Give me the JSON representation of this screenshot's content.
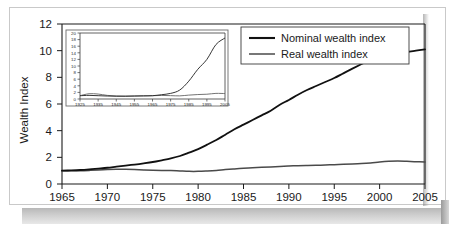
{
  "chart_data": {
    "type": "line",
    "title": "",
    "xlabel": "",
    "ylabel": "Wealth Index",
    "xlim": [
      1965,
      2005
    ],
    "ylim": [
      0,
      12
    ],
    "grid": false,
    "legend_position": "top-right",
    "xticks": [
      "1965",
      "1970",
      "1975",
      "1980",
      "1985",
      "1990",
      "1995",
      "2000",
      "2005"
    ],
    "yticks": [
      "0",
      "2",
      "4",
      "6",
      "8",
      "10",
      "12"
    ],
    "x": [
      1965,
      1966,
      1967,
      1968,
      1969,
      1970,
      1971,
      1972,
      1973,
      1974,
      1975,
      1976,
      1977,
      1978,
      1979,
      1980,
      1981,
      1982,
      1983,
      1984,
      1985,
      1986,
      1987,
      1988,
      1989,
      1990,
      1991,
      1992,
      1993,
      1994,
      1995,
      1996,
      1997,
      1998,
      1999,
      2000,
      2001,
      2002,
      2003,
      2004,
      2005
    ],
    "series": [
      {
        "name": "Nominal wealth index",
        "color": "#111111",
        "values": [
          1.0,
          1.02,
          1.05,
          1.1,
          1.16,
          1.22,
          1.3,
          1.38,
          1.46,
          1.55,
          1.65,
          1.78,
          1.92,
          2.1,
          2.35,
          2.62,
          2.95,
          3.3,
          3.7,
          4.1,
          4.45,
          4.8,
          5.15,
          5.5,
          5.95,
          6.3,
          6.7,
          7.05,
          7.35,
          7.65,
          7.95,
          8.3,
          8.65,
          9.0,
          9.35,
          9.5,
          9.62,
          9.75,
          9.9,
          10.0,
          10.1
        ]
      },
      {
        "name": "Real wealth index",
        "color": "#4a4a4a",
        "values": [
          1.0,
          1.0,
          1.0,
          1.02,
          1.05,
          1.08,
          1.1,
          1.1,
          1.08,
          1.05,
          1.03,
          1.02,
          1.01,
          0.98,
          0.95,
          0.95,
          0.98,
          1.02,
          1.08,
          1.13,
          1.18,
          1.22,
          1.25,
          1.28,
          1.32,
          1.35,
          1.37,
          1.38,
          1.4,
          1.42,
          1.45,
          1.48,
          1.5,
          1.53,
          1.58,
          1.65,
          1.7,
          1.72,
          1.7,
          1.67,
          1.65
        ]
      }
    ],
    "inset": {
      "type": "line",
      "xlim": [
        1925,
        2005
      ],
      "ylim": [
        0,
        20
      ],
      "xticks": [
        "1925",
        "1935",
        "1945",
        "1955",
        "1965",
        "1975",
        "1985",
        "1995",
        "2005"
      ],
      "yticks": [
        "0",
        "2",
        "4",
        "6",
        "8",
        "10",
        "12",
        "14",
        "16",
        "18",
        "20"
      ],
      "x": [
        1925,
        1930,
        1935,
        1940,
        1945,
        1950,
        1955,
        1960,
        1965,
        1970,
        1975,
        1980,
        1985,
        1990,
        1995,
        2000,
        2005
      ],
      "series": [
        {
          "name": "Nominal wealth index",
          "color": "#2b2b2b",
          "values": [
            1.0,
            1.1,
            1.0,
            0.9,
            0.85,
            0.85,
            0.9,
            0.95,
            1.0,
            1.3,
            1.7,
            2.7,
            5.4,
            9.0,
            12.0,
            16.5,
            18.5
          ]
        },
        {
          "name": "Real wealth index",
          "color": "#6d6d6d",
          "values": [
            1.0,
            1.6,
            1.5,
            1.1,
            0.9,
            0.85,
            0.9,
            0.95,
            1.0,
            1.08,
            1.02,
            0.95,
            1.18,
            1.35,
            1.45,
            1.7,
            1.65
          ]
        }
      ]
    }
  },
  "legend": {
    "entries": [
      {
        "label": "Nominal wealth index"
      },
      {
        "label": "Real wealth index"
      }
    ]
  }
}
